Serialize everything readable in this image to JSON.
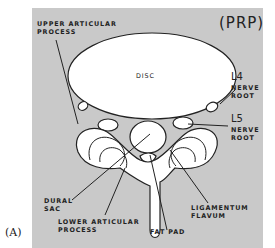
{
  "figure": {
    "panel_label": "(A)",
    "corner_tag": "(PRP)",
    "colors": {
      "background": "#c9c9c9",
      "structure_fill": "#ffffff",
      "outline": "#222222"
    }
  },
  "labels": {
    "upper_articular": "UPPER ARTICULAR\nPROCESS",
    "disc": "DISC",
    "l4_level": "L4",
    "l4_root": "NERVE\nROOT",
    "l5_level": "L5",
    "l5_root": "NERVE\nROOT",
    "dural_sac": "DURAL\nSAC",
    "lower_articular": "LOWER ARTICULAR\nPROCESS",
    "fat_pad": "FAT PAD",
    "ligamentum": "LIGAMENTUM\nFLAVUM"
  }
}
